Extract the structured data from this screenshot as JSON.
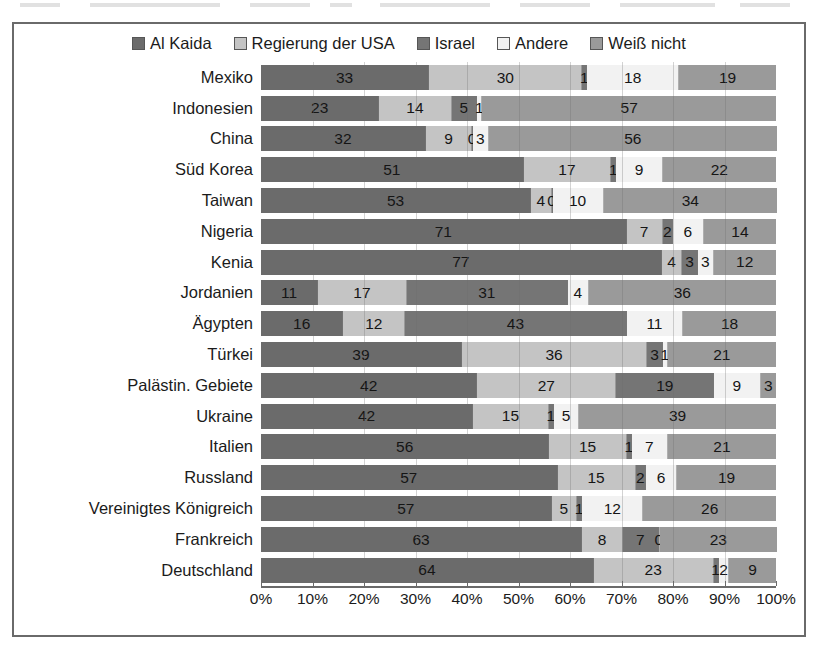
{
  "chart_data": {
    "type": "bar",
    "subtype": "stacked-horizontal-100-percent",
    "title": "",
    "xlabel": "",
    "ylabel": "",
    "xlim": [
      0,
      100
    ],
    "grid": true,
    "legend_position": "top",
    "axis_ticks": [
      "0%",
      "10%",
      "20%",
      "30%",
      "40%",
      "50%",
      "60%",
      "70%",
      "80%",
      "90%",
      "100%"
    ],
    "legend": [
      {
        "label": "Al Kaida",
        "color": "#6b6b6b",
        "swatch": "legend-swatch-al-kaida"
      },
      {
        "label": "Regierung der USA",
        "color": "#c4c4c4",
        "swatch": "legend-swatch-regierung-der-usa"
      },
      {
        "label": "Israel",
        "color": "#757575",
        "swatch": "legend-swatch-israel"
      },
      {
        "label": "Andere",
        "color": "#f2f2f2",
        "swatch": "legend-swatch-andere"
      },
      {
        "label": "Weiß nicht",
        "color": "#9a9a9a",
        "swatch": "legend-swatch-weiss-nicht"
      }
    ],
    "series": [
      {
        "name": "Al Kaida",
        "values": [
          33,
          23,
          32,
          51,
          53,
          71,
          77,
          11,
          16,
          39,
          42,
          42,
          56,
          57,
          57,
          63,
          64
        ]
      },
      {
        "name": "Regierung der USA",
        "values": [
          30,
          14,
          9,
          17,
          4,
          7,
          4,
          17,
          12,
          36,
          27,
          15,
          15,
          15,
          5,
          8,
          23
        ]
      },
      {
        "name": "Israel",
        "values": [
          1,
          5,
          0,
          1,
          0,
          2,
          3,
          31,
          43,
          3,
          19,
          1,
          1,
          2,
          1,
          7,
          1
        ]
      },
      {
        "name": "Andere",
        "values": [
          18,
          1,
          3,
          9,
          10,
          6,
          3,
          4,
          11,
          1,
          9,
          5,
          7,
          6,
          12,
          0,
          2
        ]
      },
      {
        "name": "Weiß nicht",
        "values": [
          19,
          57,
          56,
          22,
          34,
          14,
          12,
          36,
          18,
          21,
          3,
          39,
          21,
          19,
          26,
          23,
          9
        ]
      }
    ],
    "categories": [
      "Mexiko",
      "Indonesien",
      "China",
      "Süd Korea",
      "Taiwan",
      "Nigeria",
      "Kenia",
      "Jordanien",
      "Ägypten",
      "Türkei",
      "Palästin. Gebiete",
      "Ukraine",
      "Italien",
      "Russland",
      "Vereinigtes Königreich",
      "Frankreich",
      "Deutschland"
    ],
    "rows": [
      {
        "category": "Mexiko",
        "values": [
          33,
          30,
          1,
          18,
          19
        ]
      },
      {
        "category": "Indonesien",
        "values": [
          23,
          14,
          5,
          1,
          57
        ]
      },
      {
        "category": "China",
        "values": [
          32,
          9,
          0,
          3,
          56
        ]
      },
      {
        "category": "Süd Korea",
        "values": [
          51,
          17,
          1,
          9,
          22
        ]
      },
      {
        "category": "Taiwan",
        "values": [
          53,
          4,
          0,
          10,
          34
        ]
      },
      {
        "category": "Nigeria",
        "values": [
          71,
          7,
          2,
          6,
          14
        ]
      },
      {
        "category": "Kenia",
        "values": [
          77,
          4,
          3,
          3,
          12
        ]
      },
      {
        "category": "Jordanien",
        "values": [
          11,
          17,
          31,
          4,
          36
        ]
      },
      {
        "category": "Ägypten",
        "values": [
          16,
          12,
          43,
          11,
          18
        ]
      },
      {
        "category": "Türkei",
        "values": [
          39,
          36,
          3,
          1,
          21
        ]
      },
      {
        "category": "Palästin. Gebiete",
        "values": [
          42,
          27,
          19,
          9,
          3
        ]
      },
      {
        "category": "Ukraine",
        "values": [
          42,
          15,
          1,
          5,
          39
        ]
      },
      {
        "category": "Italien",
        "values": [
          56,
          15,
          1,
          7,
          21
        ]
      },
      {
        "category": "Russland",
        "values": [
          57,
          15,
          2,
          6,
          19
        ]
      },
      {
        "category": "Vereinigtes Königreich",
        "values": [
          57,
          5,
          1,
          12,
          26
        ]
      },
      {
        "category": "Frankreich",
        "values": [
          63,
          8,
          7,
          0,
          23
        ]
      },
      {
        "category": "Deutschland",
        "values": [
          64,
          23,
          1,
          2,
          9
        ]
      }
    ]
  }
}
